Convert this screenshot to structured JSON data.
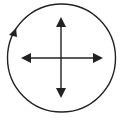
{
  "diagram": {
    "colors": {
      "stroke": "#222222",
      "background": "#ffffff"
    },
    "circle": {
      "cx": 61.5,
      "cy": 58,
      "r": 54,
      "rotation_direction": "clockwise"
    },
    "cross": {
      "arrows": [
        "up",
        "down",
        "left",
        "right"
      ]
    },
    "icons": {
      "rotation": "rotate-clockwise-icon",
      "cross": "four-way-arrows-icon"
    }
  }
}
